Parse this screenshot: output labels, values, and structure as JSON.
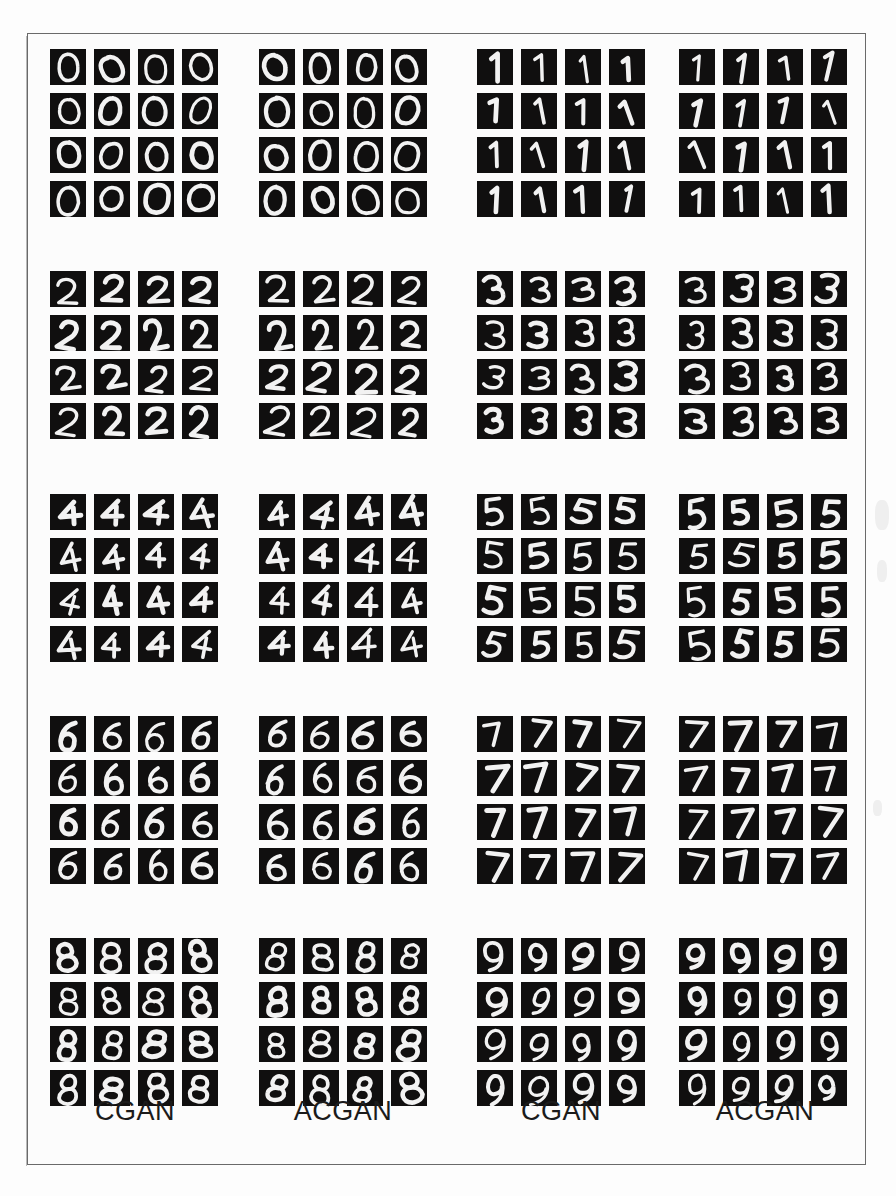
{
  "figure": {
    "type": "image-grid-figure",
    "columns": [
      {
        "id": "col-1",
        "caption": "CGAN",
        "model": "CGAN",
        "digits": [
          0,
          2,
          4,
          6,
          8
        ]
      },
      {
        "id": "col-2",
        "caption": "ACGAN",
        "model": "ACGAN",
        "digits": [
          0,
          2,
          4,
          6,
          8
        ]
      },
      {
        "id": "col-3",
        "caption": "CGAN",
        "model": "CGAN",
        "digits": [
          1,
          3,
          5,
          7,
          9
        ]
      },
      {
        "id": "col-4",
        "caption": "ACGAN",
        "model": "ACGAN",
        "digits": [
          1,
          3,
          5,
          7,
          9
        ]
      }
    ],
    "grid": {
      "rows_per_block": 4,
      "cols_per_block": 4,
      "samples_per_block": 16,
      "blocks_per_column": 5,
      "tile_background": "#100f0f",
      "stroke_color": "#f2f2f2"
    },
    "captions": [
      {
        "label": "CGAN",
        "left": 22
      },
      {
        "label": "ACGAN",
        "left": 230
      },
      {
        "label": "CGAN",
        "left": 448
      },
      {
        "label": "ACGAN",
        "left": 652
      }
    ],
    "row_digit_labels": [
      {
        "left_pair": 0,
        "right_pair": 1
      },
      {
        "left_pair": 2,
        "right_pair": 3
      },
      {
        "left_pair": 4,
        "right_pair": 5
      },
      {
        "left_pair": 6,
        "right_pair": 7
      },
      {
        "left_pair": 8,
        "right_pair": 9
      }
    ],
    "colors": {
      "page_background": "#fdfdfd",
      "frame_border": "#6a6a6a",
      "panel_background": "#fcfcfc",
      "tile": "#100f0f",
      "ink": "#1b1b1b"
    },
    "layout": {
      "frame_left": 27,
      "frame_top": 33,
      "frame_width": 839,
      "frame_height": 1132,
      "column_offsets": [
        22,
        231,
        449,
        651
      ],
      "block_offsets_y": [
        15,
        237,
        460,
        682,
        904
      ],
      "tile_size": 36,
      "tile_gap": 8
    }
  }
}
